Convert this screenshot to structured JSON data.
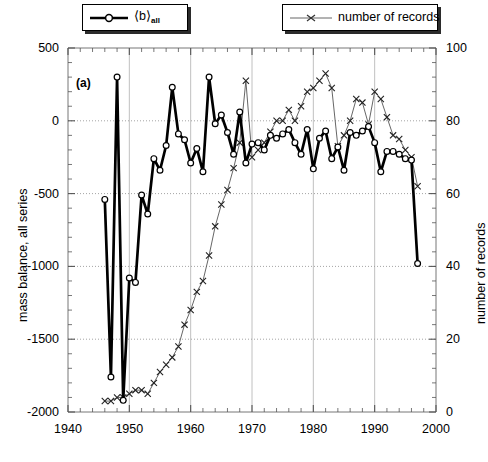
{
  "figure": {
    "panel_label": "(a)",
    "background": "#ffffff"
  },
  "legend": {
    "mass_balance": {
      "label_main": "⟨b⟩",
      "label_sub": "all",
      "marker": "circle-marker",
      "color": "#000000"
    },
    "records": {
      "label": "number of records",
      "marker": "x-marker",
      "color": "#555555"
    }
  },
  "axes": {
    "x": {
      "title": "",
      "min": 1940,
      "max": 2000,
      "ticks": [
        1940,
        1950,
        1960,
        1970,
        1980,
        1990,
        2000
      ],
      "tick_labels": [
        "1940",
        "1950",
        "1960",
        "1970",
        "1980",
        "1990",
        "2000"
      ],
      "minor_step": 2
    },
    "y_left": {
      "title": "mass balance, all series",
      "min": -2000,
      "max": 500,
      "ticks": [
        500,
        0,
        -500,
        -1000,
        -1500,
        -2000
      ],
      "tick_labels": [
        "500",
        "0",
        "-500",
        "-1000",
        "-1500",
        "-2000"
      ],
      "minor_step": 100
    },
    "y_right": {
      "title": "number of records",
      "min": 0,
      "max": 100,
      "ticks": [
        100,
        80,
        60,
        40,
        20,
        0
      ],
      "tick_labels": [
        "100",
        "80",
        "60",
        "40",
        "20",
        "0"
      ],
      "minor_step": 4
    }
  },
  "chart_data": {
    "type": "line",
    "title": "",
    "xlabel": "",
    "ylabel": "mass balance, all series",
    "y2label": "number of records",
    "xlim": [
      1940,
      2000
    ],
    "ylim": [
      -2000,
      500
    ],
    "y2lim": [
      0,
      100
    ],
    "grid": true,
    "legend_position": "top",
    "series": [
      {
        "name": "⟨b⟩ all",
        "axis": "left",
        "style": "thick-line-circle-markers",
        "color": "#000000",
        "x": [
          1946,
          1947,
          1948,
          1949,
          1950,
          1951,
          1952,
          1953,
          1954,
          1955,
          1956,
          1957,
          1958,
          1959,
          1960,
          1961,
          1962,
          1963,
          1964,
          1965,
          1966,
          1967,
          1968,
          1969,
          1970,
          1971,
          1972,
          1973,
          1974,
          1975,
          1976,
          1977,
          1978,
          1979,
          1980,
          1981,
          1982,
          1983,
          1984,
          1985,
          1986,
          1987,
          1988,
          1989,
          1990,
          1991,
          1992,
          1993,
          1994,
          1995,
          1996,
          1997
        ],
        "y": [
          -540,
          -1760,
          300,
          -1920,
          -1080,
          -1110,
          -510,
          -640,
          -260,
          -340,
          -170,
          230,
          -90,
          -130,
          -290,
          -190,
          -350,
          300,
          -20,
          40,
          -80,
          -230,
          60,
          -290,
          -160,
          -150,
          -200,
          -100,
          -120,
          -90,
          -60,
          -150,
          -230,
          -60,
          -330,
          -120,
          -70,
          -260,
          -180,
          -340,
          -80,
          -100,
          -70,
          -40,
          -150,
          -350,
          -210,
          -210,
          -230,
          -260,
          -270,
          -980
        ]
      },
      {
        "name": "number of records",
        "axis": "right",
        "style": "thin-line-x-markers",
        "color": "#555555",
        "x": [
          1946,
          1947,
          1948,
          1949,
          1950,
          1951,
          1952,
          1953,
          1954,
          1955,
          1956,
          1957,
          1958,
          1959,
          1960,
          1961,
          1962,
          1963,
          1964,
          1965,
          1966,
          1967,
          1968,
          1969,
          1970,
          1971,
          1972,
          1973,
          1974,
          1975,
          1976,
          1977,
          1978,
          1979,
          1980,
          1981,
          1982,
          1983,
          1984,
          1985,
          1986,
          1987,
          1988,
          1989,
          1990,
          1991,
          1992,
          1993,
          1994,
          1995,
          1996,
          1997
        ],
        "y": [
          3,
          3,
          4,
          4,
          5,
          6,
          6,
          5,
          8,
          11,
          13,
          15,
          18,
          24,
          28,
          33,
          36,
          43,
          51,
          57,
          61,
          67,
          74,
          91,
          70,
          72,
          74,
          77,
          80,
          80,
          83,
          80,
          84,
          88,
          89,
          91,
          93,
          89,
          73,
          76,
          80,
          86,
          85,
          79,
          88,
          86,
          81,
          76,
          75,
          72,
          70,
          62
        ]
      }
    ]
  }
}
